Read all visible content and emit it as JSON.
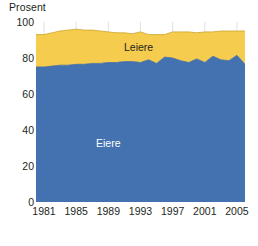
{
  "chart_data": {
    "type": "area",
    "title": "",
    "subtitle": "",
    "ylabel": "Prosent",
    "xlabel": "",
    "ylim": [
      0,
      100
    ],
    "xlim": [
      1980,
      2006
    ],
    "ytick_labels": [
      "0",
      "20",
      "40",
      "60",
      "80",
      "100"
    ],
    "ytick_values": [
      0,
      20,
      40,
      60,
      80,
      100
    ],
    "xtick_labels": [
      "1981",
      "1985",
      "1989",
      "1993",
      "1997",
      "2001",
      "2005"
    ],
    "xtick_values": [
      1981,
      1985,
      1989,
      1993,
      1997,
      2001,
      2005
    ],
    "grid": "vertical",
    "legend": "inline-labels",
    "stacked": true,
    "x": [
      1980,
      1981,
      1982,
      1983,
      1984,
      1985,
      1986,
      1987,
      1988,
      1989,
      1990,
      1991,
      1992,
      1993,
      1994,
      1995,
      1996,
      1997,
      1998,
      1999,
      2000,
      2001,
      2002,
      2003,
      2004,
      2005,
      2006
    ],
    "series": [
      {
        "name": "Eiere",
        "color": "#4472B0",
        "values": [
          75,
          75,
          75.5,
          76,
          76,
          76.5,
          76.5,
          77,
          77,
          77.5,
          77.5,
          78,
          78,
          77.5,
          79,
          77,
          80.5,
          80,
          78.5,
          77.5,
          79.5,
          77.5,
          81,
          79,
          78.5,
          81.5,
          76.5
        ]
      },
      {
        "name": "Leiere",
        "color": "#F5CC4D",
        "values": [
          18,
          18,
          18.5,
          19,
          19.5,
          19.5,
          19,
          18.5,
          18,
          17,
          16.5,
          16,
          15.5,
          17,
          14,
          16,
          12.5,
          14.5,
          16,
          17,
          14.5,
          17,
          13.5,
          16,
          16.5,
          13.5,
          18.5
        ]
      }
    ],
    "totals": [
      93,
      93,
      94,
      95,
      95.5,
      96,
      95.5,
      95.5,
      95,
      94.5,
      94,
      94,
      93.5,
      94.5,
      93,
      93,
      93,
      94.5,
      94.5,
      94.5,
      94,
      94.5,
      94.5,
      95,
      95,
      95,
      95
    ]
  }
}
